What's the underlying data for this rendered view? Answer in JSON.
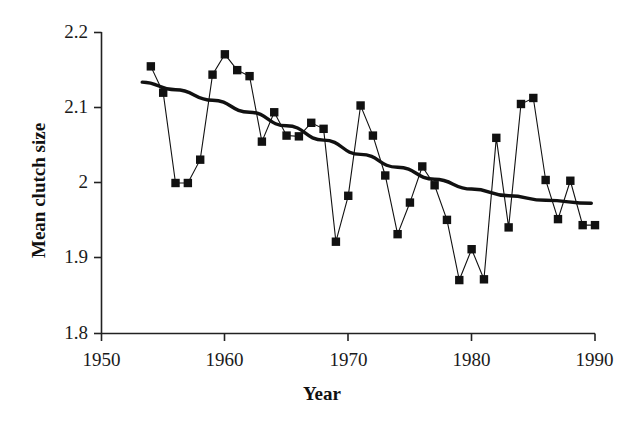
{
  "chart_data": {
    "type": "line",
    "title": "",
    "xlabel": "Year",
    "ylabel": "Mean clutch size",
    "xlim": [
      1950,
      1990
    ],
    "ylim": [
      1.8,
      2.2
    ],
    "xticks": [
      1950,
      1960,
      1970,
      1980,
      1990
    ],
    "yticks": [
      1.8,
      1.9,
      2.0,
      2.1,
      2.2
    ],
    "xtick_labels": [
      "1950",
      "1960",
      "1970",
      "1980",
      "1990"
    ],
    "ytick_labels": [
      "1.8",
      "1.9",
      "2",
      "2.1",
      "2.2"
    ],
    "grid": false,
    "legend": null,
    "series": [
      {
        "name": "Mean clutch size",
        "marker": "square",
        "marker_color": "#111111",
        "line_color": "#111111",
        "x": [
          1954,
          1955,
          1956,
          1957,
          1958,
          1959,
          1960,
          1961,
          1962,
          1963,
          1964,
          1965,
          1966,
          1967,
          1968,
          1969,
          1970,
          1971,
          1972,
          1973,
          1974,
          1975,
          1976,
          1977,
          1978,
          1979,
          1980,
          1981,
          1982,
          1983,
          1984,
          1985,
          1986,
          1987,
          1988,
          1989,
          1990
        ],
        "values": [
          2.155,
          2.12,
          2.0,
          2.0,
          2.031,
          2.144,
          2.171,
          2.15,
          2.142,
          2.055,
          2.094,
          2.063,
          2.062,
          2.08,
          2.072,
          1.922,
          1.983,
          2.103,
          2.063,
          2.01,
          1.932,
          1.974,
          2.022,
          1.997,
          1.951,
          1.871,
          1.912,
          1.872,
          2.06,
          1.941,
          2.105,
          2.113,
          2.004,
          1.952,
          2.003,
          1.944,
          1.944
        ]
      },
      {
        "name": "fitted trend",
        "marker": "none",
        "line_color": "#111111",
        "x": [
          1953.3,
          1956,
          1959,
          1962,
          1965,
          1968,
          1971,
          1974,
          1977,
          1980,
          1983,
          1986,
          1989.7
        ],
        "values": [
          2.134,
          2.124,
          2.11,
          2.094,
          2.076,
          2.057,
          2.038,
          2.021,
          2.005,
          1.992,
          1.983,
          1.977,
          1.973
        ]
      }
    ]
  },
  "axes": {
    "y_title": "Mean clutch size",
    "x_title": "Year"
  }
}
